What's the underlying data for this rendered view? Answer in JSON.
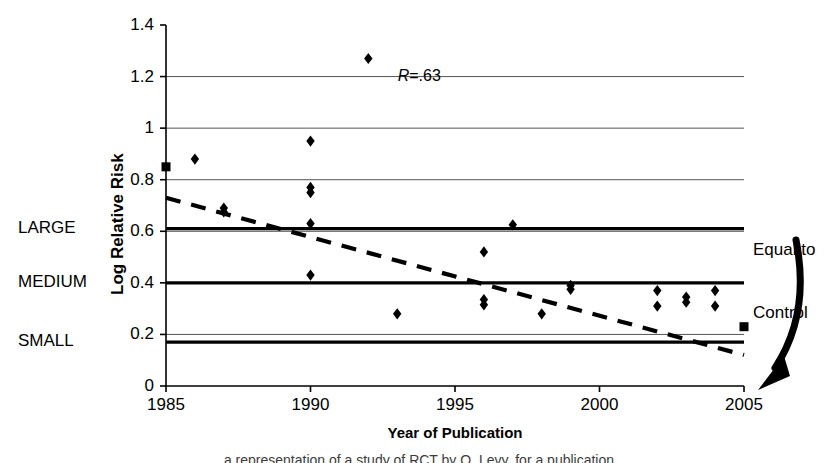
{
  "chart_data": {
    "type": "scatter",
    "title": "",
    "xlabel": "Year of Publication",
    "ylabel": "Log Relative Risk",
    "xlim": [
      1985,
      2005
    ],
    "ylim": [
      0,
      1.4
    ],
    "grid": true,
    "legend": "none",
    "xticks": [
      "1985",
      "1990",
      "1995",
      "2000",
      "2005"
    ],
    "yticks": [
      "0",
      "0.2",
      "0.4",
      "0.6",
      "0.8",
      "1",
      "1.2",
      "1.4"
    ],
    "ytick_values": [
      0,
      0.2,
      0.4,
      0.6,
      0.8,
      1.0,
      1.2,
      1.4
    ],
    "xtick_values": [
      1985,
      1990,
      1995,
      2000,
      2005
    ],
    "gridlines_y": [
      0.2,
      0.6,
      0.8,
      1.0,
      1.2
    ],
    "series": [
      {
        "name": "studies-diamond",
        "marker": "diamond",
        "points": [
          {
            "x": 1986,
            "y": 0.88
          },
          {
            "x": 1987,
            "y": 0.69
          },
          {
            "x": 1987,
            "y": 0.675
          },
          {
            "x": 1990,
            "y": 0.95
          },
          {
            "x": 1990,
            "y": 0.77
          },
          {
            "x": 1990,
            "y": 0.75
          },
          {
            "x": 1990,
            "y": 0.63
          },
          {
            "x": 1990,
            "y": 0.43
          },
          {
            "x": 1992,
            "y": 1.27
          },
          {
            "x": 1993,
            "y": 0.28
          },
          {
            "x": 1996,
            "y": 0.52
          },
          {
            "x": 1996,
            "y": 0.335
          },
          {
            "x": 1996,
            "y": 0.315
          },
          {
            "x": 1997,
            "y": 0.625
          },
          {
            "x": 1998,
            "y": 0.28
          },
          {
            "x": 1999,
            "y": 0.39
          },
          {
            "x": 1999,
            "y": 0.375
          },
          {
            "x": 2002,
            "y": 0.37
          },
          {
            "x": 2002,
            "y": 0.31
          },
          {
            "x": 2003,
            "y": 0.345
          },
          {
            "x": 2003,
            "y": 0.325
          },
          {
            "x": 2004,
            "y": 0.37
          },
          {
            "x": 2004,
            "y": 0.31
          }
        ]
      },
      {
        "name": "studies-square",
        "marker": "square",
        "points": [
          {
            "x": 1985,
            "y": 0.85
          },
          {
            "x": 2005,
            "y": 0.23
          }
        ]
      }
    ],
    "trendline": {
      "style": "dashed",
      "x_start": 1985,
      "y_start": 0.73,
      "x_end": 2005,
      "y_end": 0.12
    },
    "reference_lines": [
      {
        "label": "LARGE",
        "value": 0.61,
        "weight": "thick"
      },
      {
        "label": "MEDIUM",
        "value": 0.4,
        "weight": "thick"
      },
      {
        "label": "SMALL",
        "value": 0.17,
        "weight": "thick"
      }
    ],
    "annotations": [
      {
        "name": "correlation",
        "text_italic": "R",
        "text_rest": "=.63",
        "x": 1992.4,
        "y": 1.265
      },
      {
        "name": "equal-to-control",
        "text": "Equal to\nControl"
      }
    ]
  },
  "axis": {
    "y_title": "Log Relative Risk",
    "x_title": "Year of Publication"
  },
  "side_labels": {
    "large": "LARGE",
    "medium": "MEDIUM",
    "small": "SMALL"
  },
  "callout": {
    "line1": "Equal to",
    "line2": "Control"
  },
  "correlation": {
    "symbol": "R",
    "value": "=.63"
  },
  "caption": {
    "text": "a representation of a study of RCT by Q. Levy, for a publication"
  },
  "colors": {
    "ink": "#000000",
    "gridline": "#555555"
  }
}
